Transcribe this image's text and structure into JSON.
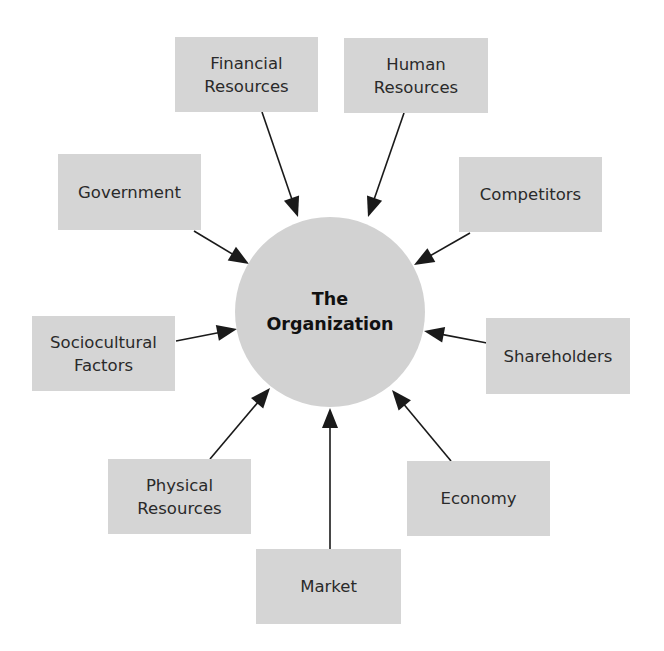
{
  "diagram": {
    "type": "hub-and-spoke",
    "center": {
      "label": "The\nOrganization",
      "cx": 330,
      "cy": 312,
      "r": 95
    },
    "colors": {
      "box_fill": "#d5d5d5",
      "center_fill": "#d2d2d2",
      "arrow": "#1a1a1a",
      "text": "#2a2a2a"
    },
    "nodes": [
      {
        "id": "financial",
        "label": "Financial\nResources",
        "x": 175,
        "y": 37,
        "w": 143,
        "h": 75,
        "arrow": [
          262,
          112,
          298,
          217
        ]
      },
      {
        "id": "human",
        "label": "Human\nResources",
        "x": 344,
        "y": 38,
        "w": 144,
        "h": 75,
        "arrow": [
          404,
          113,
          368,
          217
        ]
      },
      {
        "id": "government",
        "label": "Government",
        "x": 58,
        "y": 154,
        "w": 143,
        "h": 76,
        "arrow": [
          194,
          231,
          249,
          264
        ]
      },
      {
        "id": "competitors",
        "label": "Competitors",
        "x": 459,
        "y": 157,
        "w": 143,
        "h": 75,
        "arrow": [
          470,
          233,
          414,
          265
        ]
      },
      {
        "id": "sociocultural",
        "label": "Sociocultural\nFactors",
        "x": 32,
        "y": 316,
        "w": 143,
        "h": 75,
        "arrow": [
          176,
          341,
          237,
          329
        ]
      },
      {
        "id": "shareholders",
        "label": "Shareholders",
        "x": 486,
        "y": 318,
        "w": 144,
        "h": 76,
        "arrow": [
          487,
          343,
          424,
          331
        ]
      },
      {
        "id": "physical",
        "label": "Physical\nResources",
        "x": 108,
        "y": 459,
        "w": 143,
        "h": 75,
        "arrow": [
          210,
          459,
          270,
          388
        ]
      },
      {
        "id": "economy",
        "label": "Economy",
        "x": 407,
        "y": 461,
        "w": 143,
        "h": 75,
        "arrow": [
          451,
          461,
          392,
          390
        ]
      },
      {
        "id": "market",
        "label": "Market",
        "x": 256,
        "y": 549,
        "w": 145,
        "h": 75,
        "arrow": [
          330,
          549,
          330,
          408
        ]
      }
    ]
  }
}
